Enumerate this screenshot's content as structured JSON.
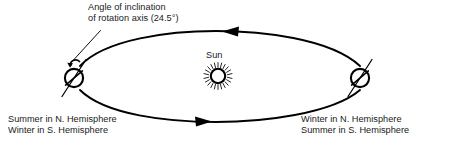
{
  "diagram": {
    "background_color": "#ffffff",
    "stroke_color": "#000000",
    "text_color": "#1a1a1a",
    "annotation": {
      "line1": "Angle of inclination",
      "line2": "of rotation axis (24.5°)",
      "tilt_degrees": "24.5°"
    },
    "sun": {
      "label": "Sun",
      "icon": "sun-icon"
    },
    "left_position": {
      "label_line1": "Summer in N. Hemisphere",
      "label_line2": "Winter in S. Hemisphere",
      "body": "earth-icon"
    },
    "right_position": {
      "label_line1": "Winter in N. Hemisphere",
      "label_line2": "Summer in S. Hemisphere",
      "body": "earth-icon"
    },
    "orbit": {
      "shape": "ellipse",
      "direction_top_arrow": "left",
      "direction_bottom_arrow": "right"
    }
  }
}
